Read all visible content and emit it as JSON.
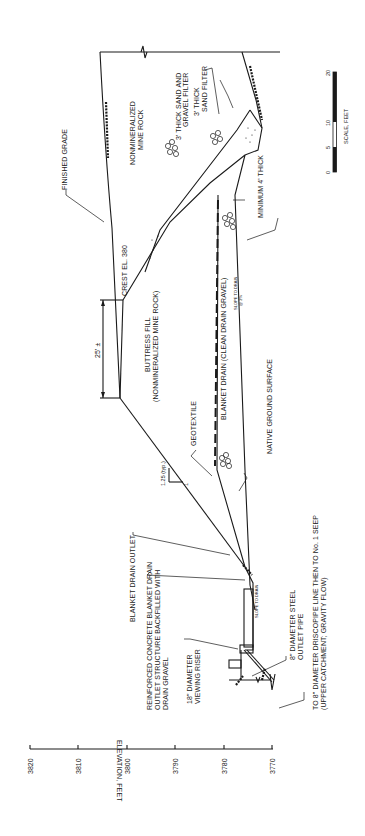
{
  "figure": {
    "orientation": "rotated 90 degrees counter-clockwise",
    "type": "embankment cross-section"
  },
  "axis": {
    "label": "ELEVATION, FEET",
    "ticks": [
      "3820",
      "3810",
      "3800",
      "3790",
      "3780",
      "3770"
    ]
  },
  "scale_bar": {
    "label": "SCALE, FEET",
    "ticks": [
      "0",
      "5",
      "10",
      "20"
    ]
  },
  "labels": {
    "finished_grade": "FINISHED GRADE",
    "crest": "CREST EL. 380",
    "nonmineralized_1": "NONMINERALIZED",
    "nonmineralized_2": "MINE ROCK",
    "sand_gravel_1": "3' THICK SAND AND",
    "sand_gravel_2": "GRAVEL FILTER",
    "sand_filter_1": "3' THICK",
    "sand_filter_2": "SAND FILTER",
    "minimum_thick": "MINIMUM 4' THICK",
    "dimension": "25' ±",
    "buttress_1": "BUTTRESS FILL",
    "buttress_2": "(NONMINERALIZED MINE ROCK)",
    "blanket_drain": "BLANKET DRAIN (CLEAN DRAIN GRAVEL)",
    "native_ground": "NATIVE GROUND SURFACE",
    "geotextile": "GEOTEXTILE",
    "slope_ratio": "1.25 (typ.)",
    "slope_one": "1",
    "blanket_outlet": "BLANKET DRAIN OUTLET",
    "concrete_1": "REINFORCED CONCRETE BLANKET DRAIN",
    "concrete_2": "OUTLET STRUCTURE BACKFILLED WITH",
    "concrete_3": "DRAIN GRAVEL",
    "riser_1": "18\" DIAMETER",
    "riser_2": "VIEWING RISER",
    "steel_pipe_1": "8\" DIAMETER STEEL",
    "steel_pipe_2": "OUTLET PIPE",
    "driscopipe_1": "TO 8\" DIAMETER DRISCOPIPE LINE THEN TO No. 1 SEEP",
    "driscopipe_2": "(UPPER CATCHMENT; GRAVITY FLOW)",
    "slope_note": "SLOPE TO DRAIN",
    "slope_note_pct": "@ 2%"
  }
}
